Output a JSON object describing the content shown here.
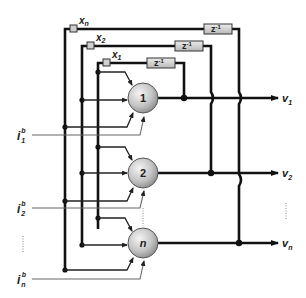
{
  "diagram": {
    "type": "hopfield-network",
    "inputs": [
      {
        "name": "x",
        "sub": "n"
      },
      {
        "name": "x",
        "sub": "2"
      },
      {
        "name": "x",
        "sub": "1"
      }
    ],
    "delays": [
      {
        "label": "z",
        "sup": "-1"
      },
      {
        "label": "z",
        "sup": "-1"
      },
      {
        "label": "z",
        "sup": "-1"
      }
    ],
    "neurons": [
      {
        "label": "1"
      },
      {
        "label": "2"
      },
      {
        "label": "n"
      }
    ],
    "outputs": [
      {
        "name": "v",
        "sub": "1"
      },
      {
        "name": "v",
        "sub": "2"
      },
      {
        "name": "v",
        "sub": "n"
      }
    ],
    "biases": [
      {
        "name": "i",
        "sub": "1",
        "sup": "b"
      },
      {
        "name": "i",
        "sub": "2",
        "sup": "b"
      },
      {
        "name": "i",
        "sub": "n",
        "sup": "b"
      }
    ],
    "colors": {
      "line": "#111111",
      "thin_line": "#555555",
      "neuron_fill_light": "#f2f2f2",
      "neuron_fill_dark": "#9a9a9a",
      "box_fill": "#d8d8d8"
    }
  }
}
